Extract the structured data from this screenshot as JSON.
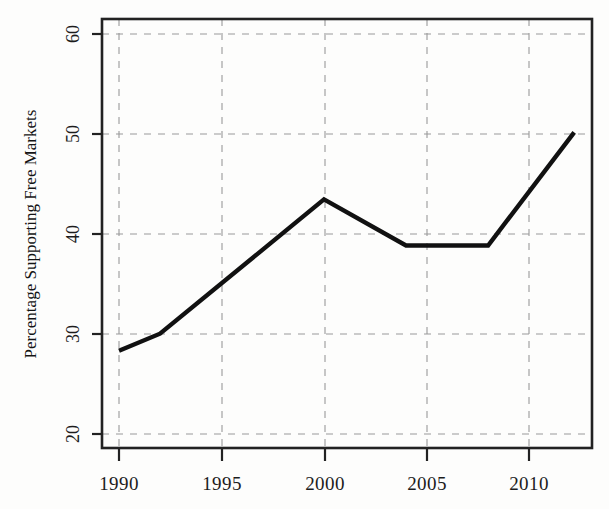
{
  "figure": {
    "width": 609,
    "height": 509,
    "background_color": "#fdfdfc",
    "line_color": "#111111",
    "grid_color": "#9a9a9a",
    "frame_color": "#222222"
  },
  "chart_data": {
    "type": "line",
    "title": "",
    "xlabel": "",
    "ylabel": "Percentage Supporting Free Markets",
    "xlim": [
      1989.2,
      1012.0
    ],
    "x_range": [
      1989.2,
      2013.0
    ],
    "ylim": [
      18.6,
      61.4
    ],
    "grid": true,
    "grid_style": "dashed",
    "legend": false,
    "legend_position": "none",
    "xticks": [
      1990,
      1995,
      2000,
      2005,
      2010
    ],
    "xtick_labels": [
      "1990",
      "1995",
      "2000",
      "2005",
      "2010"
    ],
    "yticks": [
      20,
      30,
      40,
      50,
      60
    ],
    "ytick_labels": [
      "20",
      "30",
      "40",
      "50",
      "60"
    ],
    "series": [
      {
        "name": "Percentage Supporting Free Markets",
        "color": "#111111",
        "x": [
          1990,
          1992,
          2000,
          2004,
          2008,
          2012.2
        ],
        "values": [
          28.3,
          30.0,
          43.4,
          38.8,
          38.8,
          50.1
        ],
        "points": [
          {
            "year": 1990,
            "value": 28.3
          },
          {
            "year": 1992,
            "value": 30.0
          },
          {
            "year": 2000,
            "value": 43.4
          },
          {
            "year": 2004,
            "value": 38.8
          },
          {
            "year": 2008,
            "value": 38.8
          },
          {
            "year": 2012,
            "value": 50.1
          }
        ]
      }
    ]
  },
  "plot_geometry": {
    "left": 102,
    "right": 592,
    "top": 19,
    "bottom": 448,
    "y_value_top": 61.4,
    "y_value_bottom": 18.6,
    "x_value_left": 1989.17,
    "x_value_right": 2013.07
  }
}
